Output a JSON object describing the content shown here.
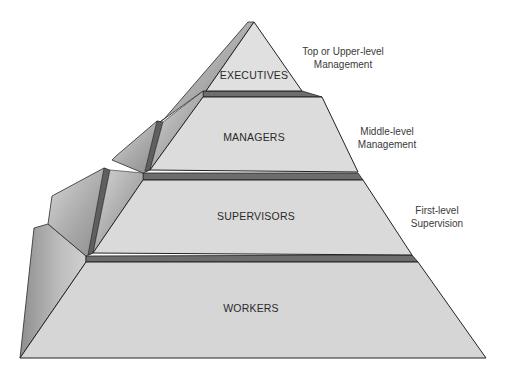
{
  "diagram": {
    "type": "pyramid",
    "levels": [
      {
        "label": "EXECUTIVES",
        "note_line1": "Top or Upper-level",
        "note_line2": "Management"
      },
      {
        "label": "MANAGERS",
        "note_line1": "Middle-level",
        "note_line2": "Management"
      },
      {
        "label": "SUPERVISORS",
        "note_line1": "First-level",
        "note_line2": "Supervision"
      },
      {
        "label": "WORKERS",
        "note_line1": "",
        "note_line2": ""
      }
    ],
    "colors": {
      "front_face": "#dcdcdc",
      "side_face_light": "#c9c9c9",
      "side_face_dark": "#7c7c7c",
      "ledge": "#6b6b6b",
      "outline": "#1f1f1f"
    }
  }
}
